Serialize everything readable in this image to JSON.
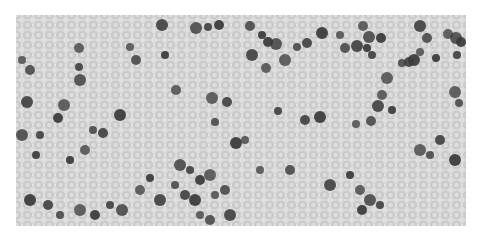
{
  "image": {
    "kind": "grayscale blood smear micrograph",
    "background_color": "#e4e4e4",
    "rbc_color": "#c9c9c9",
    "rbc_center_color": "#dedede",
    "nucleus_color": "#3a3a3a",
    "dark_cells": [
      [
        22,
        60
      ],
      [
        30,
        70
      ],
      [
        27,
        102
      ],
      [
        36,
        155
      ],
      [
        79,
        48
      ],
      [
        80,
        80
      ],
      [
        79,
        67
      ],
      [
        58,
        118
      ],
      [
        64,
        105
      ],
      [
        93,
        130
      ],
      [
        103,
        133
      ],
      [
        120,
        115
      ],
      [
        130,
        47
      ],
      [
        136,
        60
      ],
      [
        162,
        25
      ],
      [
        165,
        55
      ],
      [
        176,
        90
      ],
      [
        196,
        28
      ],
      [
        208,
        27
      ],
      [
        219,
        25
      ],
      [
        212,
        98
      ],
      [
        215,
        122
      ],
      [
        227,
        102
      ],
      [
        236,
        143
      ],
      [
        245,
        140
      ],
      [
        250,
        26
      ],
      [
        252,
        55
      ],
      [
        262,
        35
      ],
      [
        266,
        68
      ],
      [
        276,
        44
      ],
      [
        278,
        111
      ],
      [
        268,
        42
      ],
      [
        285,
        60
      ],
      [
        297,
        47
      ],
      [
        307,
        43
      ],
      [
        322,
        33
      ],
      [
        340,
        35
      ],
      [
        345,
        48
      ],
      [
        357,
        46
      ],
      [
        367,
        48
      ],
      [
        363,
        26
      ],
      [
        369,
        37
      ],
      [
        372,
        55
      ],
      [
        381,
        38
      ],
      [
        387,
        78
      ],
      [
        402,
        63
      ],
      [
        409,
        62
      ],
      [
        414,
        60
      ],
      [
        420,
        52
      ],
      [
        427,
        38
      ],
      [
        420,
        26
      ],
      [
        436,
        58
      ],
      [
        448,
        34
      ],
      [
        456,
        38
      ],
      [
        457,
        55
      ],
      [
        461,
        42
      ],
      [
        455,
        92
      ],
      [
        459,
        103
      ],
      [
        305,
        120
      ],
      [
        320,
        117
      ],
      [
        356,
        124
      ],
      [
        371,
        121
      ],
      [
        378,
        106
      ],
      [
        392,
        110
      ],
      [
        382,
        95
      ],
      [
        180,
        165
      ],
      [
        190,
        170
      ],
      [
        200,
        180
      ],
      [
        210,
        175
      ],
      [
        175,
        185
      ],
      [
        185,
        195
      ],
      [
        195,
        200
      ],
      [
        215,
        195
      ],
      [
        225,
        190
      ],
      [
        160,
        200
      ],
      [
        150,
        178
      ],
      [
        140,
        190
      ],
      [
        122,
        210
      ],
      [
        110,
        205
      ],
      [
        95,
        215
      ],
      [
        80,
        210
      ],
      [
        60,
        215
      ],
      [
        48,
        205
      ],
      [
        30,
        200
      ],
      [
        260,
        170
      ],
      [
        290,
        170
      ],
      [
        330,
        185
      ],
      [
        350,
        175
      ],
      [
        360,
        190
      ],
      [
        370,
        200
      ],
      [
        380,
        205
      ],
      [
        362,
        210
      ],
      [
        420,
        150
      ],
      [
        430,
        155
      ],
      [
        440,
        140
      ],
      [
        455,
        160
      ],
      [
        200,
        215
      ],
      [
        210,
        220
      ],
      [
        230,
        215
      ],
      [
        70,
        160
      ],
      [
        85,
        150
      ],
      [
        22,
        135
      ],
      [
        40,
        135
      ]
    ]
  }
}
